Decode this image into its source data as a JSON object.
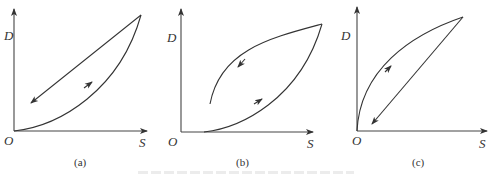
{
  "figure": {
    "panels": [
      {
        "id": "a",
        "caption": "(a)",
        "y_axis_label": "D",
        "x_axis_label": "S",
        "origin_label": "O",
        "description": "Loading curve concave-up from origin to peak; unloading straight line back toward lower-left with arrow"
      },
      {
        "id": "b",
        "caption": "(b)",
        "y_axis_label": "D",
        "x_axis_label": "S",
        "origin_label": "O",
        "description": "Loading curve starts on S-axis offset from origin, concave-up to peak; unloading concave-down curve ending above S-axis"
      },
      {
        "id": "c",
        "caption": "(c)",
        "y_axis_label": "D",
        "x_axis_label": "S",
        "origin_label": "O",
        "description": "Loading curve concave-down from origin to peak; unloading straight line back toward origin with arrow"
      }
    ],
    "colors": {
      "stroke": "#333333",
      "axis": "#444444"
    }
  }
}
